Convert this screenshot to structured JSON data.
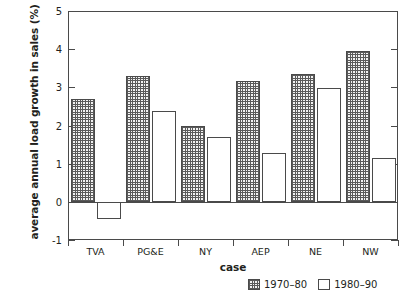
{
  "chart_data": {
    "type": "bar",
    "title": "",
    "xlabel": "case",
    "ylabel": "average annual load growth in sales (%)",
    "categories": [
      "TVA",
      "PG&E",
      "NY",
      "AEP",
      "NE",
      "NW"
    ],
    "series": [
      {
        "name": "1970–80",
        "values": [
          2.7,
          3.3,
          1.98,
          3.16,
          3.35,
          3.95
        ]
      },
      {
        "name": "1980–90",
        "values": [
          -0.45,
          2.38,
          1.7,
          1.27,
          2.97,
          1.16
        ]
      }
    ],
    "ylim": [
      -1,
      5
    ],
    "yticks": [
      -1,
      0,
      1,
      2,
      3,
      4,
      5
    ],
    "ytick_labels": [
      "-1",
      "0",
      "1",
      "2",
      "3",
      "4",
      "5"
    ],
    "grid": false,
    "legend_position": "bottom-right",
    "zero_line": 0
  },
  "legend": {
    "items": [
      {
        "label": "1970–80",
        "swatch": "hatched-swatch"
      },
      {
        "label": "1980–90",
        "swatch": "empty-swatch"
      }
    ]
  },
  "axes": {
    "y_title": "average annual load growth in sales (%)",
    "x_title": "case"
  }
}
